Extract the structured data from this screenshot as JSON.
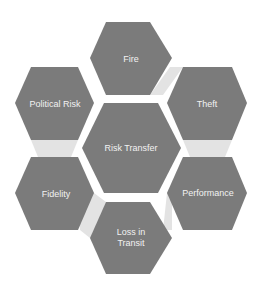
{
  "diagram": {
    "type": "hexagon-cluster",
    "colors": {
      "hex_fill": "#7b7b7b",
      "connector_fill": "#e3e3e3",
      "text": "#f2f2f2",
      "background": "#ffffff"
    },
    "center": {
      "label": "Risk Transfer"
    },
    "nodes": [
      {
        "id": "fire",
        "label": "Fire"
      },
      {
        "id": "theft",
        "label": "Theft"
      },
      {
        "id": "performance",
        "label": "Performance"
      },
      {
        "id": "loss-in-transit",
        "label": "Loss in\nTransit"
      },
      {
        "id": "fidelity",
        "label": "Fidelity"
      },
      {
        "id": "political-risk",
        "label": "Political Risk"
      }
    ],
    "connectors": [
      {
        "from": "fire",
        "to": "theft"
      },
      {
        "from": "theft",
        "to": "performance"
      },
      {
        "from": "performance",
        "to": "loss-in-transit"
      },
      {
        "from": "loss-in-transit",
        "to": "fidelity"
      },
      {
        "from": "fidelity",
        "to": "political-risk"
      }
    ]
  }
}
